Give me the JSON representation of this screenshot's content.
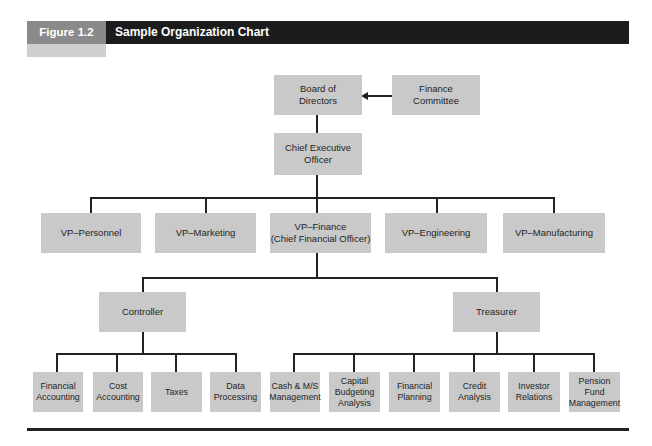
{
  "figure": {
    "label": "Figure 1.2",
    "title": "Sample Organization Chart",
    "colors": {
      "header_bg": "#1c1c1c",
      "label_bg": "#8a8a8a",
      "tab_bg": "#cfcfcf",
      "box_bg": "#c9c9c9",
      "line": "#222222"
    }
  },
  "chart": {
    "top": {
      "board": "Board of\nDirectors",
      "finance_committee": "Finance\nCommittee",
      "ceo": "Chief Executive\nOfficer"
    },
    "vps": [
      "VP–Personnel",
      "VP–Marketing",
      "VP–Finance\n(Chief Financial Officer)",
      "VP–Engineering",
      "VP–Manufacturing"
    ],
    "finance_reports": {
      "controller": "Controller",
      "treasurer": "Treasurer"
    },
    "controller_units": [
      "Financial\nAccounting",
      "Cost\nAccounting",
      "Taxes",
      "Data\nProcessing"
    ],
    "treasurer_units": [
      "Cash & M/S\nManagement",
      "Capital\nBudgeting\nAnalysis",
      "Financial\nPlanning",
      "Credit\nAnalysis",
      "Investor\nRelations",
      "Pension Fund\nManagement"
    ]
  }
}
